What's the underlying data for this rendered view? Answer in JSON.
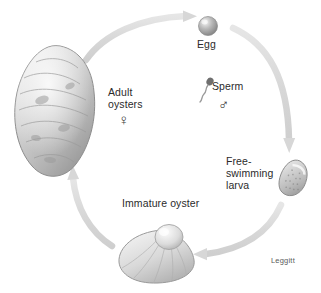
{
  "diagram": {
    "credit": "Leggitt",
    "background_color": "#ffffff",
    "arrow_color": "#dcdcdc",
    "text_color": "#2b2b2b"
  },
  "stages": {
    "adult": {
      "label": "Adult\noysters",
      "symbol": "♀",
      "symbol_name": "female-symbol",
      "illustration": "adult-oyster-shell"
    },
    "egg": {
      "label": "Egg",
      "illustration": "egg-sphere"
    },
    "sperm": {
      "label": "Sperm",
      "symbol": "♂",
      "symbol_name": "male-symbol",
      "illustration": "sperm-cell"
    },
    "larva": {
      "label": "Free-\nswimming\nlarva",
      "illustration": "larva-shell"
    },
    "immature": {
      "label": "Immature oyster",
      "illustration": "immature-oyster-shell"
    }
  },
  "arrows": [
    {
      "name": "adult-to-egg",
      "direction": "clockwise-top-left"
    },
    {
      "name": "egg-to-larva",
      "direction": "clockwise-right"
    },
    {
      "name": "larva-to-immature",
      "direction": "clockwise-bottom"
    },
    {
      "name": "immature-to-adult",
      "direction": "clockwise-left"
    }
  ]
}
